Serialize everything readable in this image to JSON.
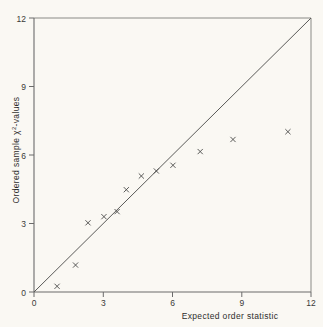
{
  "chart_data": {
    "type": "scatter",
    "title": "",
    "subtitle": "",
    "xlabel": "Expected order statistic",
    "ylabel": "Ordered sample χ²-values",
    "ylabel_parts": {
      "pre": "Ordered sample ",
      "symbol": "χ",
      "sup": "2",
      "post": "-values"
    },
    "xlim": [
      0,
      12
    ],
    "ylim": [
      0,
      12
    ],
    "xticks": [
      0,
      3,
      6,
      9,
      12
    ],
    "yticks": [
      0,
      3,
      6,
      9,
      12
    ],
    "xtick_labels": [
      "0",
      "3",
      "6",
      "9",
      "12"
    ],
    "ytick_labels": [
      "0",
      "3",
      "6",
      "9",
      "12"
    ],
    "grid": false,
    "legend": false,
    "legend_position": "none",
    "marker": "x",
    "marker_color": "#4a4a48",
    "series": [
      {
        "name": "Ordered sample chi-square values",
        "marker": "x",
        "points": [
          {
            "x": 1.0,
            "y": 0.25
          },
          {
            "x": 1.8,
            "y": 1.18
          },
          {
            "x": 2.34,
            "y": 3.03
          },
          {
            "x": 3.03,
            "y": 3.3
          },
          {
            "x": 3.6,
            "y": 3.52
          },
          {
            "x": 4.0,
            "y": 4.48
          },
          {
            "x": 4.65,
            "y": 5.08
          },
          {
            "x": 5.3,
            "y": 5.3
          },
          {
            "x": 6.02,
            "y": 5.55
          },
          {
            "x": 7.2,
            "y": 6.15
          },
          {
            "x": 8.62,
            "y": 6.68
          },
          {
            "x": 11.0,
            "y": 7.02
          }
        ]
      }
    ],
    "reference_line": {
      "name": "45-degree identity line",
      "from": [
        0,
        0
      ],
      "to": [
        12,
        12
      ],
      "color": "#5a5a58"
    },
    "colors": {
      "background": "#faf8f3",
      "axis": "#6b6b6b",
      "frame": "#8a8a86",
      "text": "#2e2e2c",
      "marker": "#4a4a48"
    }
  }
}
